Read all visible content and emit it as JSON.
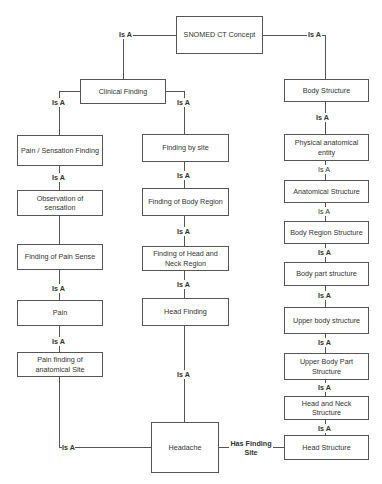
{
  "diagram": {
    "type": "hierarchy",
    "relation_default": "Is A",
    "nodes": {
      "root": "SNOMED CT Concept",
      "clinical_finding": "Clinical Finding",
      "body_structure": "Body Structure",
      "pain_sensation": "Pain / Sensation Finding",
      "observation_sensation": "Observation of sensation",
      "finding_pain_sense": "Finding of Pain Sense",
      "pain": "Pain",
      "pain_finding_site": "Pain finding of anatomical Site",
      "finding_by_site": "Finding by site",
      "finding_body_region": "Finding of Body Region",
      "finding_head_neck": "Finding of Head and Neck Region",
      "head_finding": "Head Finding",
      "headache": "Headache",
      "physical_entity": "Physical anatomical entity",
      "anatomical_structure": "Anatomical Structure",
      "body_region_structure": "Body Region Structure",
      "body_part_structure": "Body part structure",
      "upper_body_structure": "Upper body structure",
      "upper_body_part_structure": "Upper Body Part Structure",
      "head_neck_structure": "Head and Neck Structure",
      "head_structure": "Head Structure"
    },
    "labels": {
      "is_a": "Is A",
      "has_finding_site": "Has Finding Site"
    },
    "edges": [
      {
        "from": "clinical_finding",
        "to": "root",
        "label": "Is A"
      },
      {
        "from": "body_structure",
        "to": "root",
        "label": "Is A"
      },
      {
        "from": "pain_sensation",
        "to": "clinical_finding",
        "label": "Is A"
      },
      {
        "from": "finding_by_site",
        "to": "clinical_finding",
        "label": "Is A"
      },
      {
        "from": "observation_sensation",
        "to": "pain_sensation",
        "label": "Is A"
      },
      {
        "from": "finding_pain_sense",
        "to": "observation_sensation",
        "label": ""
      },
      {
        "from": "pain",
        "to": "finding_pain_sense",
        "label": "Is A"
      },
      {
        "from": "pain_finding_site",
        "to": "pain",
        "label": "Is A"
      },
      {
        "from": "headache",
        "to": "pain_finding_site",
        "label": "Is A"
      },
      {
        "from": "finding_body_region",
        "to": "finding_by_site",
        "label": "Is A"
      },
      {
        "from": "finding_head_neck",
        "to": "finding_body_region",
        "label": "Is A"
      },
      {
        "from": "head_finding",
        "to": "finding_head_neck",
        "label": "Is A"
      },
      {
        "from": "headache",
        "to": "head_finding",
        "label": "Is A"
      },
      {
        "from": "physical_entity",
        "to": "body_structure",
        "label": "Is A"
      },
      {
        "from": "anatomical_structure",
        "to": "physical_entity",
        "label": "Is A"
      },
      {
        "from": "body_region_structure",
        "to": "anatomical_structure",
        "label": "Is A"
      },
      {
        "from": "body_part_structure",
        "to": "body_region_structure",
        "label": "Is A"
      },
      {
        "from": "upper_body_structure",
        "to": "body_part_structure",
        "label": "Is A"
      },
      {
        "from": "upper_body_part_structure",
        "to": "upper_body_structure",
        "label": "Is A"
      },
      {
        "from": "head_neck_structure",
        "to": "upper_body_part_structure",
        "label": "Is A"
      },
      {
        "from": "head_structure",
        "to": "head_neck_structure",
        "label": "Is A"
      },
      {
        "from": "headache",
        "to": "head_structure",
        "label": "Has Finding Site"
      }
    ]
  }
}
